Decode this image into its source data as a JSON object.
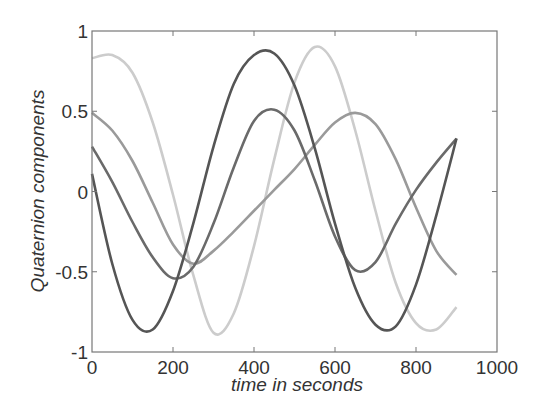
{
  "chart_data": {
    "type": "line",
    "title": "",
    "xlabel": "time in seconds",
    "ylabel": "Quaternion components",
    "xlim": [
      0,
      1000
    ],
    "ylim": [
      -1,
      1
    ],
    "xticks": [
      0,
      200,
      400,
      600,
      800,
      1000
    ],
    "xtick_labels": [
      "0",
      "200",
      "400",
      "600",
      "800",
      "1000"
    ],
    "yticks": [
      -1,
      -0.5,
      0,
      0.5,
      1
    ],
    "ytick_labels": [
      "-1",
      "-0.5",
      "0",
      "0.5",
      "1"
    ],
    "grid": false,
    "legend": null,
    "x": [
      0,
      50,
      100,
      150,
      200,
      250,
      300,
      350,
      400,
      450,
      500,
      550,
      600,
      650,
      700,
      750,
      800,
      850,
      900
    ],
    "series": [
      {
        "name": "q1",
        "color": "#555555",
        "values": [
          0.11,
          -0.45,
          -0.8,
          -0.86,
          -0.62,
          -0.2,
          0.28,
          0.67,
          0.85,
          0.86,
          0.66,
          0.27,
          -0.2,
          -0.6,
          -0.83,
          -0.84,
          -0.58,
          -0.15,
          0.33
        ]
      },
      {
        "name": "q2",
        "color": "#6a6a6a",
        "values": [
          0.28,
          0.06,
          -0.19,
          -0.41,
          -0.54,
          -0.47,
          -0.2,
          0.15,
          0.44,
          0.51,
          0.38,
          0.07,
          -0.28,
          -0.49,
          -0.44,
          -0.2,
          0.01,
          0.18,
          0.33
        ]
      },
      {
        "name": "q3",
        "color": "#9a9a9a",
        "values": [
          0.49,
          0.38,
          0.19,
          -0.07,
          -0.33,
          -0.45,
          -0.37,
          -0.25,
          -0.12,
          0.01,
          0.14,
          0.29,
          0.43,
          0.49,
          0.42,
          0.2,
          -0.1,
          -0.37,
          -0.52
        ]
      },
      {
        "name": "q4",
        "color": "#cccccc",
        "values": [
          0.83,
          0.85,
          0.74,
          0.43,
          -0.02,
          -0.52,
          -0.88,
          -0.76,
          -0.34,
          0.2,
          0.68,
          0.9,
          0.78,
          0.38,
          -0.12,
          -0.57,
          -0.82,
          -0.86,
          -0.72
        ]
      }
    ]
  },
  "colors": {
    "axis": "#777777",
    "text": "#333333",
    "background": "#ffffff"
  }
}
